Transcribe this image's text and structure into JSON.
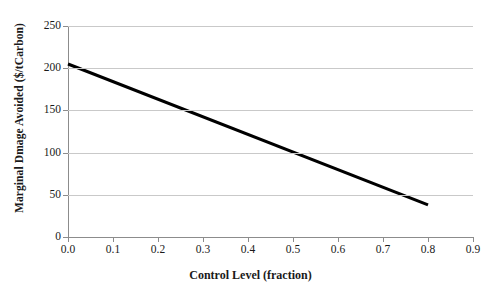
{
  "chart_data": {
    "type": "line",
    "title": "",
    "xlabel": "Control Level (fraction)",
    "ylabel": "Marginal Dmage Avoided ($/tCarbon)",
    "xlim": [
      0.0,
      0.9
    ],
    "ylim": [
      0,
      250
    ],
    "grid": "horizontal",
    "legend": "none",
    "line_color": "#000000",
    "line_width_px": 3,
    "xticks": [
      0.0,
      0.1,
      0.2,
      0.3,
      0.4,
      0.5,
      0.6,
      0.7,
      0.8,
      0.9
    ],
    "xtick_labels": [
      "0.0",
      "0.1",
      "0.2",
      "0.3",
      "0.4",
      "0.5",
      "0.6",
      "0.7",
      "0.8",
      "0.9"
    ],
    "yticks": [
      0,
      50,
      100,
      150,
      200,
      250
    ],
    "ytick_labels": [
      "0",
      "50",
      "100",
      "150",
      "200",
      "250"
    ],
    "series": [
      {
        "name": "Marginal Damage Avoided",
        "x": [
          0.0,
          0.8
        ],
        "values": [
          205,
          38
        ]
      }
    ]
  },
  "axis_color": "#8c8c8c",
  "grid_color": "#c9c9c9",
  "background": "#ffffff"
}
